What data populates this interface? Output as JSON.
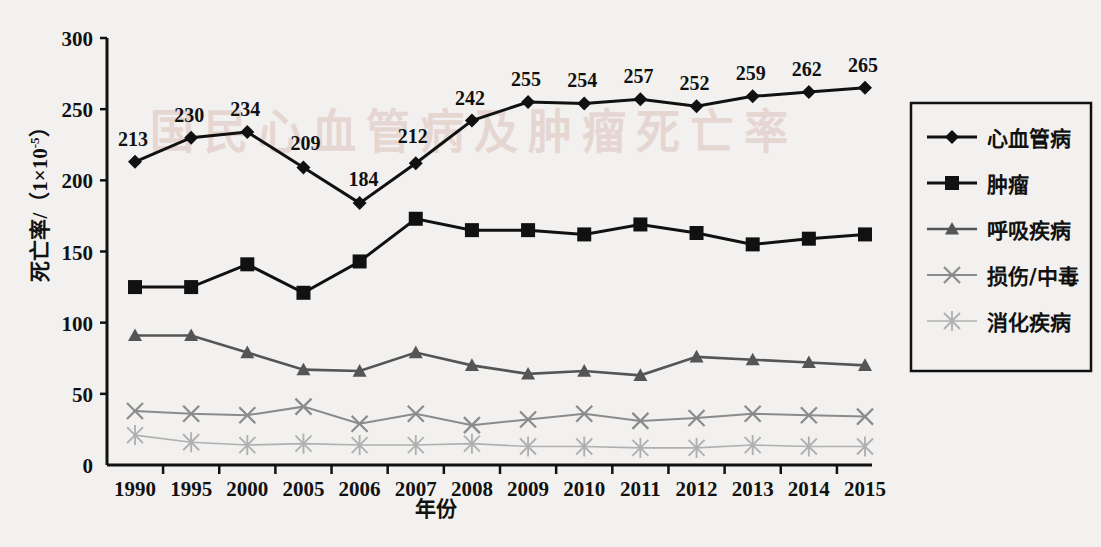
{
  "chart_data": {
    "type": "line",
    "title": "",
    "xlabel": "年份",
    "ylabel": "死亡率/（1×10⁻⁵）",
    "ylabel_main": "死亡率/（1×10",
    "ylabel_exp": "-5",
    "ylabel_tail": "）",
    "x": [
      "1990",
      "1995",
      "2000",
      "2005",
      "2006",
      "2007",
      "2008",
      "2009",
      "2010",
      "2011",
      "2012",
      "2013",
      "2014",
      "2015"
    ],
    "categories": [
      "1990",
      "1995",
      "2000",
      "2005",
      "2006",
      "2007",
      "2008",
      "2009",
      "2010",
      "2011",
      "2012",
      "2013",
      "2014",
      "2015"
    ],
    "yticks": [
      "0",
      "50",
      "100",
      "150",
      "200",
      "250",
      "300"
    ],
    "ylim": [
      0,
      300
    ],
    "grid": false,
    "legend_position": "right",
    "series": [
      {
        "name": "心血管病",
        "marker": "diamond",
        "color": "#111111",
        "values": [
          213,
          230,
          234,
          209,
          184,
          212,
          242,
          255,
          254,
          257,
          252,
          259,
          262,
          265
        ],
        "data_labels": [
          "213",
          "230",
          "234",
          "209",
          "184",
          "212",
          "242",
          "255",
          "254",
          "257",
          "252",
          "259",
          "262",
          "265"
        ],
        "show_labels": true
      },
      {
        "name": "肿瘤",
        "marker": "square",
        "color": "#111111",
        "values": [
          125,
          125,
          141,
          121,
          143,
          173,
          165,
          165,
          162,
          169,
          163,
          155,
          159,
          162
        ],
        "show_labels": false
      },
      {
        "name": "呼吸疾病",
        "marker": "triangle",
        "color": "#555555",
        "values": [
          91,
          91,
          79,
          67,
          66,
          79,
          70,
          64,
          66,
          63,
          76,
          74,
          72,
          70
        ],
        "show_labels": false
      },
      {
        "name": "损伤/中毒",
        "marker": "cross",
        "color": "#8b8b8b",
        "values": [
          38,
          36,
          35,
          41,
          29,
          36,
          28,
          32,
          36,
          31,
          33,
          36,
          35,
          34
        ],
        "show_labels": false
      },
      {
        "name": "消化疾病",
        "marker": "asterisk",
        "color": "#b0b0b0",
        "values": [
          21,
          16,
          14,
          15,
          14,
          14,
          15,
          13,
          13,
          12,
          12,
          14,
          13,
          13
        ],
        "show_labels": false
      }
    ]
  },
  "legend": {
    "items": [
      {
        "label": "心血管病",
        "marker": "diamond",
        "color": "#111111"
      },
      {
        "label": "肿瘤",
        "marker": "square",
        "color": "#111111"
      },
      {
        "label": "呼吸疾病",
        "marker": "triangle",
        "color": "#555555"
      },
      {
        "label": "损伤/中毒",
        "marker": "cross",
        "color": "#8b8b8b"
      },
      {
        "label": "消化疾病",
        "marker": "asterisk",
        "color": "#b0b0b0"
      }
    ]
  },
  "watermark": {
    "text": "国民心血管病及肿瘤死亡率"
  },
  "page": {
    "background": "#f2f1ef",
    "axis_color": "#111111"
  }
}
